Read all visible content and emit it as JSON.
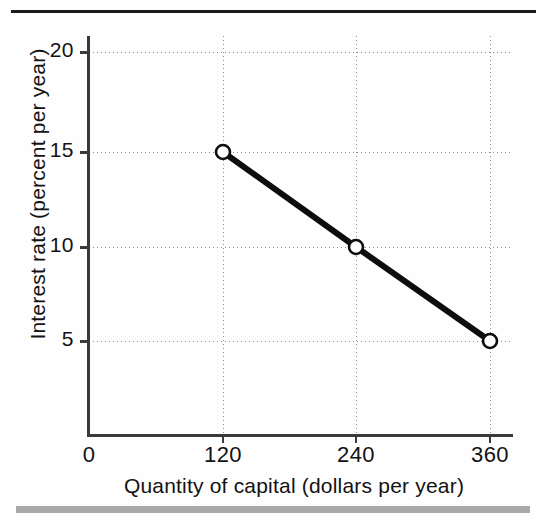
{
  "figure": {
    "background_color": "#fefefe",
    "rule_color": "#1a1a1a",
    "bottom_bar_color": "#a8a8a8"
  },
  "chart_data": {
    "type": "line",
    "title": "",
    "subtitle": "",
    "xlabel": "Quantity of capital (dollars per year)",
    "ylabel": "Interest rate (percent per year)",
    "x": [
      120,
      240,
      360
    ],
    "values": [
      15,
      10,
      5
    ],
    "series": [
      {
        "name": "Demand for capital",
        "x": [
          120,
          240,
          360
        ],
        "values": [
          15,
          10,
          5
        ]
      }
    ],
    "xlim": [
      0,
      420
    ],
    "ylim": [
      0,
      22
    ],
    "xticks": [
      0,
      120,
      240,
      360
    ],
    "xtick_labels": [
      "0",
      "120",
      "240",
      "360"
    ],
    "yticks": [
      5,
      10,
      15,
      20
    ],
    "ytick_labels": [
      "5",
      "10",
      "15",
      "20"
    ],
    "grid": true,
    "grid_style": "dotted",
    "legend": "none",
    "marker": "open-circle",
    "line_color": "#0d0d0d",
    "line_width": 6,
    "marker_fill": "#ffffff",
    "marker_edge": "#0d0d0d",
    "annotations": []
  },
  "tick_geometry": {
    "y": [
      {
        "label": "20",
        "value": 20,
        "px": 52
      },
      {
        "label": "15",
        "value": 15,
        "px": 152
      },
      {
        "label": "10",
        "value": 10,
        "px": 247
      },
      {
        "label": "5",
        "value": 5,
        "px": 341
      }
    ],
    "x": [
      {
        "label": "0",
        "value": 0,
        "px": 89
      },
      {
        "label": "120",
        "value": 120,
        "px": 223
      },
      {
        "label": "240",
        "value": 240,
        "px": 356
      },
      {
        "label": "360",
        "value": 360,
        "px": 490
      }
    ]
  },
  "points_px": [
    {
      "label": "120, 15",
      "cx": 223,
      "cy": 152
    },
    {
      "label": "240, 10",
      "cx": 356,
      "cy": 247
    },
    {
      "label": "360, 5",
      "cx": 490,
      "cy": 341
    }
  ]
}
